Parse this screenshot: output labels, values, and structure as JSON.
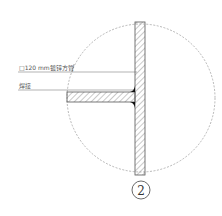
{
  "drawing": {
    "type": "detail-section",
    "detail_number": "2",
    "labels": [
      {
        "text": "□120 mm镀锌方管",
        "meaning": "120 mm galvanized square steel tube"
      },
      {
        "text": "焊接",
        "meaning": "weld"
      }
    ],
    "colors": {
      "line": "#555555",
      "hatch": "#777777",
      "weld": "#111111",
      "dashed_circle": "#999999"
    }
  }
}
